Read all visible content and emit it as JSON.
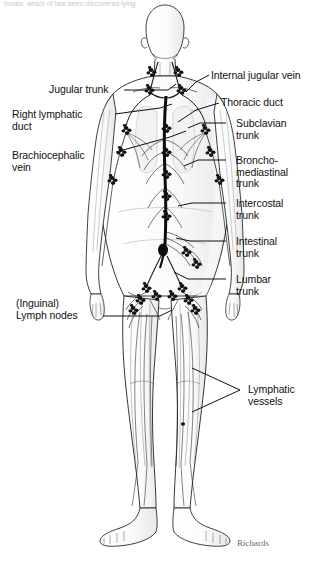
{
  "figure": {
    "title_truncated": "trunks, which of late been discovered lying",
    "signature": "Richards",
    "ink_color": "#1a1a1a",
    "background_color": "#ffffff"
  },
  "labels_left": [
    {
      "id": "jugular-trunk",
      "text": "Jugular trunk",
      "x": 49,
      "y": 84,
      "leader": [
        [
          124,
          90
        ],
        [
          168,
          90
        ],
        [
          176,
          84
        ]
      ]
    },
    {
      "id": "right-lymphatic-duct",
      "text": "Right lymphatic\nduct",
      "x": 12,
      "y": 109,
      "leader": [
        [
          115,
          114
        ],
        [
          160,
          108
        ],
        [
          172,
          104
        ]
      ]
    },
    {
      "id": "brachiocephalic-vein",
      "text": "Brachiocephalic\nvein",
      "x": 12,
      "y": 150,
      "leader": [
        [
          116,
          152
        ],
        [
          170,
          137
        ],
        [
          186,
          131
        ]
      ]
    },
    {
      "id": "inguinal-lymph-nodes",
      "text": "(Inguinal)\nLymph nodes",
      "x": 16,
      "y": 298,
      "leader": [
        [
          103,
          316
        ],
        [
          160,
          316
        ],
        [
          172,
          310
        ]
      ]
    }
  ],
  "labels_right": [
    {
      "id": "internal-jugular-vein",
      "text": "Internal jugular vein",
      "x": 211,
      "y": 70,
      "leader": [
        [
          209,
          75
        ],
        [
          196,
          82
        ],
        [
          186,
          92
        ]
      ]
    },
    {
      "id": "thoracic-duct",
      "text": "Thoracic duct",
      "x": 221,
      "y": 97,
      "leader": [
        [
          219,
          103
        ],
        [
          196,
          110
        ],
        [
          178,
          122
        ]
      ]
    },
    {
      "id": "subclavian-trunk",
      "text": "Subclavian\ntrunk",
      "x": 236,
      "y": 118,
      "leader": [
        [
          226,
          123
        ],
        [
          200,
          123
        ],
        [
          188,
          128
        ]
      ]
    },
    {
      "id": "broncho-mediastinal-trunk",
      "text": "Broncho-\nmediastinal\ntrunk",
      "x": 236,
      "y": 155,
      "leader": [
        [
          226,
          160
        ],
        [
          198,
          160
        ],
        [
          184,
          166
        ]
      ]
    },
    {
      "id": "intercostal-trunk",
      "text": "Intercostal\ntrunk",
      "x": 236,
      "y": 198,
      "leader": [
        [
          226,
          203
        ],
        [
          192,
          203
        ],
        [
          178,
          206
        ]
      ]
    },
    {
      "id": "intestinal-trunk",
      "text": "Intestinal\ntrunk",
      "x": 236,
      "y": 236,
      "leader": [
        [
          226,
          241
        ],
        [
          190,
          241
        ],
        [
          176,
          238
        ]
      ]
    },
    {
      "id": "lumbar-trunk",
      "text": "Lumbar\ntrunk",
      "x": 236,
      "y": 274,
      "leader": [
        [
          226,
          279
        ],
        [
          188,
          279
        ],
        [
          174,
          272
        ]
      ]
    },
    {
      "id": "lymphatic-vessels",
      "text": "Lymphatic\nvessels",
      "x": 248,
      "y": 384,
      "leader": [
        [
          240,
          390
        ],
        [
          192,
          368
        ]
      ],
      "leader2": [
        [
          240,
          390
        ],
        [
          192,
          412
        ]
      ]
    }
  ],
  "anatomy": {
    "node_clusters": [
      {
        "name": "cervical-nodes-left",
        "cx": 151,
        "cy": 72
      },
      {
        "name": "cervical-nodes-right",
        "cx": 176,
        "cy": 72
      },
      {
        "name": "supraclavicular-left",
        "cx": 146,
        "cy": 95
      },
      {
        "name": "supraclavicular-right",
        "cx": 183,
        "cy": 95
      },
      {
        "name": "axillary-left",
        "cx": 126,
        "cy": 131
      },
      {
        "name": "axillary-right",
        "cx": 204,
        "cy": 131
      },
      {
        "name": "cubital-left",
        "cx": 113,
        "cy": 180
      },
      {
        "name": "cubital-right",
        "cx": 216,
        "cy": 180
      },
      {
        "name": "thoracic-chain",
        "cx": 163,
        "cy": 175
      },
      {
        "name": "abdominal-chain",
        "cx": 163,
        "cy": 230
      },
      {
        "name": "iliac-left",
        "cx": 146,
        "cy": 288
      },
      {
        "name": "iliac-right",
        "cx": 182,
        "cy": 288
      },
      {
        "name": "inguinal-left",
        "cx": 143,
        "cy": 305
      },
      {
        "name": "inguinal-right",
        "cx": 186,
        "cy": 305
      }
    ]
  }
}
